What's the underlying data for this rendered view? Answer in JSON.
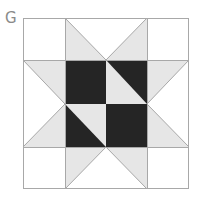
{
  "figure": {
    "label": "G",
    "colors": {
      "background": "#ffffff",
      "light": "#e6e6e6",
      "dark": "#252525",
      "line": "#a8a8a8",
      "label": "#8a8a8a"
    },
    "grid": {
      "x": [
        23,
        65,
        106,
        147,
        189
      ],
      "y": [
        18,
        60,
        104,
        147,
        189
      ]
    }
  }
}
